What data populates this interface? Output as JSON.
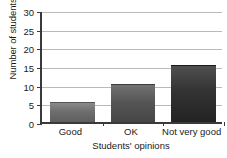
{
  "chart_data": {
    "type": "bar",
    "title": "",
    "categories": [
      "Good",
      "OK",
      "Not very good"
    ],
    "values": [
      5,
      10,
      15
    ],
    "series": [
      {
        "name": "Number of students",
        "values": [
          5,
          10,
          15
        ]
      }
    ],
    "xlabel": "Students' opinions",
    "ylabel": "Number of students",
    "ylim": [
      0,
      30
    ],
    "yticks": [
      0,
      5,
      10,
      15,
      20,
      25,
      30
    ],
    "ytick_labels": [
      "0",
      "5",
      "10",
      "15",
      "20",
      "25",
      "30"
    ],
    "grid": true,
    "legend": false,
    "legend_position": "none",
    "bar_colors": [
      "#6e6e6e",
      "#565656",
      "#333333"
    ],
    "axis_color": "#3a3a3a",
    "gridline_color": "#b9b9b9",
    "background_color": "#ffffff"
  }
}
